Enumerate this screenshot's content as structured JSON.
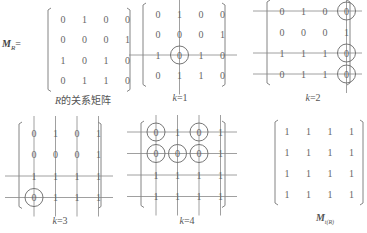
{
  "figure": {
    "left_label": {
      "symbol": "M",
      "subscript": "R",
      "equals": "="
    },
    "panels": [
      {
        "id": "R",
        "caption_italic": "R",
        "caption_rest": "的关系矩阵",
        "matrix": [
          [
            0,
            1,
            0,
            0
          ],
          [
            0,
            0,
            0,
            1
          ],
          [
            1,
            0,
            1,
            0
          ],
          [
            0,
            1,
            1,
            0
          ]
        ],
        "h_lines": [],
        "v_lines": [],
        "circles": []
      },
      {
        "id": "k1",
        "caption_italic": "k",
        "caption_rest": "=1",
        "matrix": [
          [
            0,
            1,
            0,
            0
          ],
          [
            0,
            0,
            0,
            1
          ],
          [
            1,
            0,
            1,
            0
          ],
          [
            0,
            1,
            1,
            0
          ]
        ],
        "h_lines": [
          3
        ],
        "v_lines": [
          2
        ],
        "circles": [
          [
            3,
            2
          ]
        ]
      },
      {
        "id": "k2",
        "caption_italic": "k",
        "caption_rest": "=2",
        "matrix": [
          [
            0,
            1,
            0,
            0
          ],
          [
            0,
            0,
            0,
            1
          ],
          [
            1,
            1,
            1,
            0
          ],
          [
            0,
            1,
            1,
            0
          ]
        ],
        "h_lines": [
          1,
          3,
          4
        ],
        "v_lines": [
          4
        ],
        "circles": [
          [
            1,
            4
          ],
          [
            3,
            4
          ],
          [
            4,
            4
          ]
        ]
      },
      {
        "id": "k3",
        "caption_italic": "k",
        "caption_rest": "=3",
        "matrix": [
          [
            0,
            1,
            0,
            1
          ],
          [
            0,
            0,
            0,
            1
          ],
          [
            1,
            1,
            1,
            1
          ],
          [
            0,
            1,
            1,
            1
          ]
        ],
        "h_lines": [
          3,
          4
        ],
        "v_lines": [
          1,
          2,
          3,
          4
        ],
        "circles": [
          [
            4,
            1
          ]
        ]
      },
      {
        "id": "k4",
        "caption_italic": "k",
        "caption_rest": "=4",
        "matrix": [
          [
            0,
            1,
            0,
            1
          ],
          [
            0,
            0,
            0,
            1
          ],
          [
            1,
            1,
            1,
            1
          ],
          [
            1,
            1,
            1,
            1
          ]
        ],
        "h_lines": [
          1,
          2,
          3,
          4
        ],
        "v_lines": [
          1,
          2,
          3,
          4
        ],
        "circles": [
          [
            1,
            1
          ],
          [
            1,
            3
          ],
          [
            2,
            1
          ],
          [
            2,
            2
          ],
          [
            2,
            3
          ]
        ]
      },
      {
        "id": "tR",
        "caption_symbol": "M",
        "caption_subscript": "t(R)",
        "matrix": [
          [
            1,
            1,
            1,
            1
          ],
          [
            1,
            1,
            1,
            1
          ],
          [
            1,
            1,
            1,
            1
          ],
          [
            1,
            1,
            1,
            1
          ]
        ],
        "h_lines": [],
        "v_lines": [],
        "circles": []
      }
    ]
  }
}
